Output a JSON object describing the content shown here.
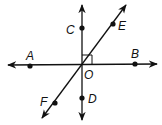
{
  "diagram": {
    "type": "geometry-lines",
    "center": {
      "label": "O",
      "x": 82,
      "y": 65
    },
    "points": [
      {
        "label": "A",
        "x": 30,
        "y": 66,
        "lx": 30,
        "ly": 58
      },
      {
        "label": "B",
        "x": 135,
        "y": 64,
        "lx": 135,
        "ly": 56
      },
      {
        "label": "C",
        "x": 82,
        "y": 28,
        "lx": 72,
        "ly": 33
      },
      {
        "label": "D",
        "x": 82,
        "y": 98,
        "lx": 93,
        "ly": 103
      },
      {
        "label": "E",
        "x": 113,
        "y": 24,
        "lx": 123,
        "ly": 30
      },
      {
        "label": "F",
        "x": 55,
        "y": 103,
        "lx": 44,
        "ly": 106
      }
    ],
    "lines": [
      {
        "name": "AB",
        "x1": 8,
        "y1": 65,
        "x2": 157,
        "y2": 64,
        "arrows": "both"
      },
      {
        "name": "CD",
        "x1": 82,
        "y1": 5,
        "x2": 82,
        "y2": 120,
        "arrows": "both"
      },
      {
        "name": "EF",
        "x1": 42,
        "y1": 118,
        "x2": 126,
        "y2": 5,
        "arrows": "both"
      }
    ],
    "right_angle_marker": {
      "at": "O",
      "between": [
        "C",
        "B"
      ],
      "size": 10
    },
    "labels": {
      "A": "A",
      "B": "B",
      "C": "C",
      "D": "D",
      "E": "E",
      "F": "F",
      "O": "O"
    },
    "colors": {
      "line": "#111111",
      "background": "#ffffff"
    }
  }
}
